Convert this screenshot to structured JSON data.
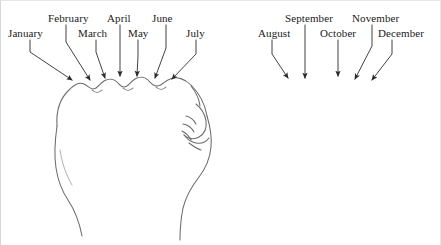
{
  "figure": {
    "name": "knuckle-month-mnemonic",
    "background_color": "#ffffff",
    "ink_color": "#5a5a5a",
    "text_color": "#1a1a1a",
    "width": 441,
    "height": 245
  },
  "hands": [
    {
      "name": "left-fist",
      "side": "left",
      "description": "closed fist viewed from above, knuckles facing up, thumb at right"
    },
    {
      "name": "right-fist",
      "side": "right",
      "description": "closed fist viewed from above, knuckles facing up, thumb at left"
    }
  ],
  "labels": [
    {
      "text": "January",
      "hand": "left",
      "row": "bottom",
      "x": 8,
      "y": 27,
      "leader": {
        "x1": 30,
        "y1": 40,
        "x2": 30,
        "y2": 52,
        "x3": 72,
        "y3": 80
      }
    },
    {
      "text": "February",
      "hand": "left",
      "row": "top",
      "x": 48,
      "y": 12,
      "leader": {
        "x1": 66,
        "y1": 25,
        "x2": 66,
        "y2": 42,
        "x3": 90,
        "y3": 80
      }
    },
    {
      "text": "March",
      "hand": "left",
      "row": "bottom",
      "x": 78,
      "y": 27,
      "leader": {
        "x1": 96,
        "y1": 40,
        "x2": 96,
        "y2": 52,
        "x3": 105,
        "y3": 78
      }
    },
    {
      "text": "April",
      "hand": "left",
      "row": "top",
      "x": 107,
      "y": 12,
      "leader": {
        "x1": 120,
        "y1": 25,
        "x2": 120,
        "y2": 50,
        "x3": 120,
        "y3": 76
      }
    },
    {
      "text": "May",
      "hand": "left",
      "row": "bottom",
      "x": 128,
      "y": 27,
      "leader": {
        "x1": 138,
        "y1": 40,
        "x2": 138,
        "y2": 56,
        "x3": 137,
        "y3": 76
      }
    },
    {
      "text": "June",
      "hand": "left",
      "row": "top",
      "x": 152,
      "y": 12,
      "leader": {
        "x1": 166,
        "y1": 25,
        "x2": 166,
        "y2": 48,
        "x3": 155,
        "y3": 78
      }
    },
    {
      "text": "July",
      "hand": "left",
      "row": "bottom",
      "x": 186,
      "y": 27,
      "leader": {
        "x1": 196,
        "y1": 40,
        "x2": 196,
        "y2": 54,
        "x3": 172,
        "y3": 79
      }
    },
    {
      "text": "August",
      "hand": "right",
      "row": "bottom",
      "x": 258,
      "y": 27,
      "leader": {
        "x1": 272,
        "y1": 40,
        "x2": 272,
        "y2": 54,
        "x3": 288,
        "y3": 78
      }
    },
    {
      "text": "September",
      "hand": "right",
      "row": "top",
      "x": 285,
      "y": 12,
      "leader": {
        "x1": 305,
        "y1": 25,
        "x2": 305,
        "y2": 50,
        "x3": 305,
        "y3": 78
      }
    },
    {
      "text": "October",
      "hand": "right",
      "row": "bottom",
      "x": 320,
      "y": 27,
      "leader": {
        "x1": 338,
        "y1": 40,
        "x2": 338,
        "y2": 56,
        "x3": 338,
        "y3": 76
      }
    },
    {
      "text": "November",
      "hand": "right",
      "row": "top",
      "x": 352,
      "y": 12,
      "leader": {
        "x1": 372,
        "y1": 25,
        "x2": 372,
        "y2": 46,
        "x3": 355,
        "y3": 79
      }
    },
    {
      "text": "December",
      "hand": "right",
      "row": "bottom",
      "x": 378,
      "y": 27,
      "leader": {
        "x1": 392,
        "y1": 40,
        "x2": 392,
        "y2": 54,
        "x3": 372,
        "y3": 80
      }
    }
  ]
}
